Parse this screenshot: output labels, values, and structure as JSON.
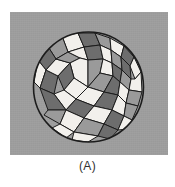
{
  "figure": {
    "caption": "(A)",
    "panel": {
      "background_color": "#9e9e9e",
      "x": 10,
      "y": 12,
      "width": 158,
      "height": 143
    },
    "page_background_color": "#ffffff",
    "outline_color": "#1c1c1c"
  },
  "diagram": {
    "type": "grain-structure-circle",
    "circle": {
      "cx": 88.5,
      "cy": 87,
      "r": 55
    },
    "fill_palette": {
      "white": "#f2f0ec",
      "light": "#e4e1dc",
      "medium": "#9a9a9a",
      "dark": "#6d6d6d",
      "darker": "#5a5a5a"
    },
    "cells": [
      {
        "id": "c01",
        "shade": "white",
        "points": "62,36 78,33 84,47 68,52"
      },
      {
        "id": "c02",
        "shade": "dark",
        "points": "78,33 95,33 100,45 84,47"
      },
      {
        "id": "c03",
        "shade": "medium",
        "points": "95,33 110,38 111,50 100,45"
      },
      {
        "id": "c04",
        "shade": "white",
        "points": "110,38 124,46 121,57 111,50"
      },
      {
        "id": "c05",
        "shade": "dark",
        "points": "124,46 134,57 130,66 121,57"
      },
      {
        "id": "c06",
        "shade": "white",
        "points": "134,57 141,72 135,79 130,66"
      },
      {
        "id": "c07",
        "shade": "medium",
        "points": "47,45 62,36 68,52 56,59"
      },
      {
        "id": "c08",
        "shade": "dark",
        "points": "38,60 47,45 56,59 46,70"
      },
      {
        "id": "c09",
        "shade": "white",
        "points": "34,82 38,60 46,70 40,88"
      },
      {
        "id": "c10",
        "shade": "dark",
        "points": "40,88 46,70 58,76 54,94"
      },
      {
        "id": "c11",
        "shade": "white",
        "points": "46,70 56,59 70,63 58,76"
      },
      {
        "id": "c12",
        "shade": "medium",
        "points": "56,59 68,52 80,58 70,63"
      },
      {
        "id": "c13",
        "shade": "white",
        "points": "68,52 84,47 88,60 80,58"
      },
      {
        "id": "c14",
        "shade": "dark",
        "points": "84,47 100,45 103,59 88,60"
      },
      {
        "id": "c15",
        "shade": "white",
        "points": "100,45 111,50 112,63 103,59"
      },
      {
        "id": "c16",
        "shade": "medium",
        "points": "111,50 121,57 122,70 112,63"
      },
      {
        "id": "c17",
        "shade": "dark",
        "points": "121,57 130,66 131,79 122,70"
      },
      {
        "id": "c18",
        "shade": "white",
        "points": "70,63 80,58 88,60 88,87 74,78"
      },
      {
        "id": "c19",
        "shade": "medium",
        "points": "88,60 103,59 100,73 88,87"
      },
      {
        "id": "c20",
        "shade": "white",
        "points": "103,59 112,63 113,76 100,73"
      },
      {
        "id": "c21",
        "shade": "dark",
        "points": "112,63 122,70 120,82 113,76"
      },
      {
        "id": "c22",
        "shade": "medium",
        "points": "122,70 131,79 129,90 120,82"
      },
      {
        "id": "c23",
        "shade": "white",
        "points": "131,79 135,79 141,72 142,92 129,90"
      },
      {
        "id": "c24",
        "shade": "dark",
        "points": "58,76 70,63 74,78 64,90"
      },
      {
        "id": "c25",
        "shade": "white",
        "points": "64,90 74,78 88,87 76,99"
      },
      {
        "id": "c26",
        "shade": "medium",
        "points": "88,87 100,73 113,76 104,92"
      },
      {
        "id": "c27",
        "shade": "dark",
        "points": "113,76 120,82 118,95 104,92"
      },
      {
        "id": "c28",
        "shade": "white",
        "points": "120,82 129,90 126,103 118,95"
      },
      {
        "id": "c29",
        "shade": "medium",
        "points": "129,90 142,92 138,106 126,103"
      },
      {
        "id": "c30",
        "shade": "white",
        "points": "54,94 64,90 76,99 66,110"
      },
      {
        "id": "c31",
        "shade": "dark",
        "points": "40,88 54,94 66,110 48,110"
      },
      {
        "id": "c32",
        "shade": "white",
        "points": "76,99 88,87 104,92 94,106"
      },
      {
        "id": "c33",
        "shade": "dark",
        "points": "94,106 104,92 118,95 112,110"
      },
      {
        "id": "c34",
        "shade": "white",
        "points": "112,110 118,95 126,103 124,116"
      },
      {
        "id": "c35",
        "shade": "medium",
        "points": "126,103 138,106 132,120 124,116"
      },
      {
        "id": "c36",
        "shade": "dark",
        "points": "66,110 76,99 94,106 84,118"
      },
      {
        "id": "c37",
        "shade": "white",
        "points": "84,118 94,106 112,110 104,124"
      },
      {
        "id": "c38",
        "shade": "medium",
        "points": "48,110 66,110 60,124 44,115"
      },
      {
        "id": "c39",
        "shade": "white",
        "points": "60,124 66,110 84,118 74,132"
      },
      {
        "id": "c40",
        "shade": "dark",
        "points": "104,124 112,110 124,116 118,130"
      },
      {
        "id": "c41",
        "shade": "white",
        "points": "118,130 124,116 132,120 128,129"
      },
      {
        "id": "c42",
        "shade": "medium",
        "points": "74,132 84,118 104,124 98,136"
      },
      {
        "id": "c43",
        "shade": "white",
        "points": "60,124 74,132 66,138 52,128"
      },
      {
        "id": "c44",
        "shade": "dark",
        "points": "98,136 104,124 118,130 110,139"
      },
      {
        "id": "c45",
        "shade": "white",
        "points": "74,132 98,136 88,142 72,140"
      }
    ]
  }
}
